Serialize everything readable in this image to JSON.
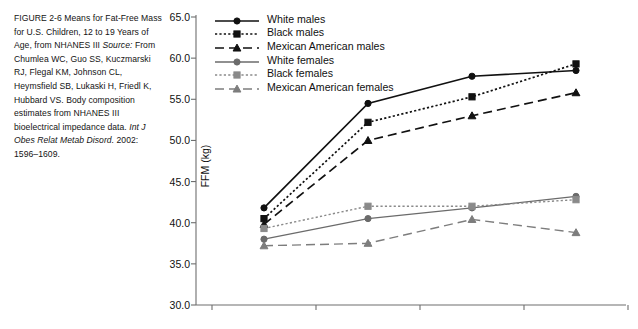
{
  "caption": {
    "figure_label": "FIGURE 2-6",
    "title": "Means for Fat-Free Mass for U.S. Children, 12 to 19 Years of Age, from NHANES III",
    "source_prefix": "Source:",
    "source_text": "From Chumlea WC, Guo SS, Kuczmarski RJ, Flegal KM, Johnson CL, Heymsfield SB, Lukaski H, Friedl K, Hubbard VS. Body composition estimates from NHANES III bioelectrical impedance data.",
    "journal": "Int J Obes Relat Metab Disord.",
    "citation_tail": "2002: 1596–1609."
  },
  "chart_data": {
    "type": "line",
    "title": "",
    "xlabel": "",
    "ylabel": "FFM (kg)",
    "categories": [
      "12–13.9",
      "14–15.9",
      "16–17.9",
      "18–19.9"
    ],
    "ylim": [
      30.0,
      65.0
    ],
    "ytick_labels": [
      "30.0",
      "35.0",
      "40.0",
      "45.0",
      "50.0",
      "55.0",
      "60.0",
      "65.0"
    ],
    "yticks": [
      30.0,
      35.0,
      40.0,
      45.0,
      50.0,
      55.0,
      60.0,
      65.0
    ],
    "grid": false,
    "legend_position": "top-left-inside",
    "series": [
      {
        "name": "White males",
        "values": [
          41.8,
          54.5,
          57.8,
          58.5
        ],
        "color": "#111111",
        "marker": "circle",
        "dash": "solid"
      },
      {
        "name": "Black males",
        "values": [
          40.5,
          52.2,
          55.3,
          59.3
        ],
        "color": "#111111",
        "marker": "square",
        "dash": "dotted"
      },
      {
        "name": "Mexican American males",
        "values": [
          39.8,
          50.0,
          53.0,
          55.8
        ],
        "color": "#111111",
        "marker": "triangle",
        "dash": "dashed"
      },
      {
        "name": "White females",
        "values": [
          38.0,
          40.5,
          41.8,
          43.2
        ],
        "color": "#6b6b6b",
        "marker": "circle",
        "dash": "solid"
      },
      {
        "name": "Black females",
        "values": [
          39.3,
          42.0,
          42.0,
          42.8
        ],
        "color": "#8a8a8a",
        "marker": "square",
        "dash": "dotted"
      },
      {
        "name": "Mexican American females",
        "values": [
          37.2,
          37.5,
          40.4,
          38.8
        ],
        "color": "#7d7d7d",
        "marker": "triangle",
        "dash": "dashed"
      }
    ]
  }
}
